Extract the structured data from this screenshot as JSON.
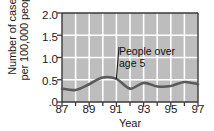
{
  "chart_data": {
    "type": "line",
    "title": "",
    "xlabel": "Year",
    "ylabel_lines": [
      "Number of cases",
      "per 100,000 people"
    ],
    "ylabel": "Number of cases per 100,000 people",
    "xlim": [
      87,
      97
    ],
    "ylim": [
      0,
      2.0
    ],
    "yticks": [
      2.0,
      1.5,
      1.0,
      0.5,
      0.0
    ],
    "ytick_labels": [
      "2.0",
      "1.5",
      "1.0",
      "0.5",
      ".0"
    ],
    "xticks": [
      87,
      89,
      91,
      93,
      95,
      97
    ],
    "xtick_labels": [
      "87",
      "89",
      "91",
      "93",
      "95",
      "97"
    ],
    "x_minor_ticks": [
      88,
      90,
      92,
      94,
      96
    ],
    "grid": true,
    "grid_color": "#ffffff",
    "plot_background": "#bdbdbd",
    "page_background": "#ffffff",
    "legend": "none",
    "series": [
      {
        "name": "People over age 5",
        "color": "#5a5a5a",
        "x": [
          87,
          88,
          89,
          90,
          91,
          92,
          93,
          94,
          95,
          96,
          97
        ],
        "values": [
          0.3,
          0.27,
          0.4,
          0.55,
          0.52,
          0.3,
          0.43,
          0.35,
          0.36,
          0.45,
          0.4
        ]
      }
    ],
    "annotations": [
      {
        "text_lines": [
          "People over",
          "age 5"
        ],
        "text": "People over age 5",
        "points_to_x": 91.0,
        "points_to_y": 0.52
      }
    ]
  }
}
